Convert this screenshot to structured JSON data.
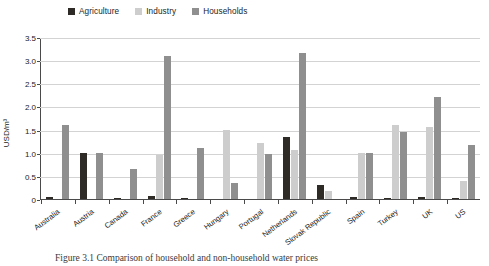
{
  "chart_data": {
    "type": "bar",
    "title": "",
    "xlabel": "",
    "ylabel": "USD/m³",
    "ylim": [
      0,
      3.5
    ],
    "ytick_values": [
      0,
      0.5,
      1.0,
      1.5,
      2.0,
      2.5,
      3.0,
      3.5
    ],
    "ytick_labels": [
      "0",
      "0.5",
      "1.0",
      "1.5",
      "2.0",
      "2.5",
      "3.0",
      "3.5"
    ],
    "grid": true,
    "legend_position": "top-left",
    "categories": [
      "Australia",
      "Austria",
      "Canada",
      "France",
      "Greece",
      "Hungary",
      "Portugal",
      "Netherlands",
      "Slovak Republic",
      "Spain",
      "Turkey",
      "UK",
      "US"
    ],
    "series": [
      {
        "name": "Agriculture",
        "color": "#2e2a26",
        "values": [
          0.05,
          1.0,
          0.03,
          0.07,
          0.02,
          0.0,
          0.0,
          1.35,
          0.3,
          0.04,
          0.03,
          0.04,
          0.03
        ]
      },
      {
        "name": "Industry",
        "color": "#cdcdcd",
        "values": [
          0.0,
          0.0,
          0.0,
          0.95,
          0.0,
          1.5,
          1.2,
          1.05,
          0.18,
          1.0,
          1.6,
          1.55,
          0.4
        ]
      },
      {
        "name": "Households",
        "color": "#8f8f8f",
        "values": [
          1.6,
          1.0,
          0.65,
          3.1,
          1.1,
          0.35,
          0.98,
          3.15,
          0.0,
          1.0,
          1.45,
          2.2,
          1.17
        ]
      }
    ]
  },
  "legend": {
    "items": [
      {
        "label": "Agriculture"
      },
      {
        "label": "Industry"
      },
      {
        "label": "Households"
      }
    ]
  },
  "caption": {
    "text": "Figure 3.1 Comparison of household and non-household water prices"
  }
}
